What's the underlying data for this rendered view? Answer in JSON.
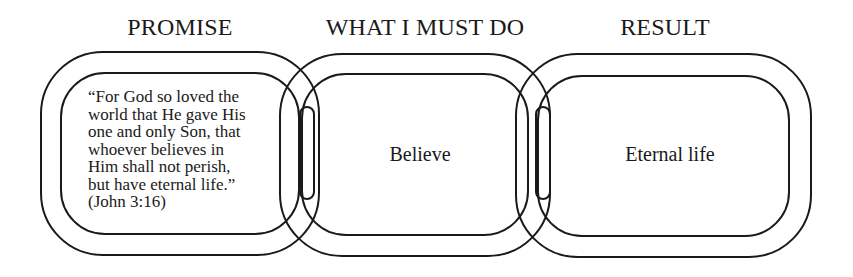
{
  "headers": {
    "promise": "PROMISE",
    "what_i_must_do": "WHAT I MUST DO",
    "result": "RESULT"
  },
  "links": [
    {
      "id": "promise",
      "lines": [
        "“For God so loved the",
        "world that He gave His",
        "one and only Son, that",
        "whoever believes in",
        "Him shall not perish,",
        "but have eternal life.”",
        "(John 3:16)"
      ]
    },
    {
      "id": "what-i-must-do",
      "label": "Believe"
    },
    {
      "id": "result",
      "label": "Eternal life"
    }
  ],
  "colors": {
    "stroke": "#1a1a1a",
    "background": "#ffffff"
  }
}
